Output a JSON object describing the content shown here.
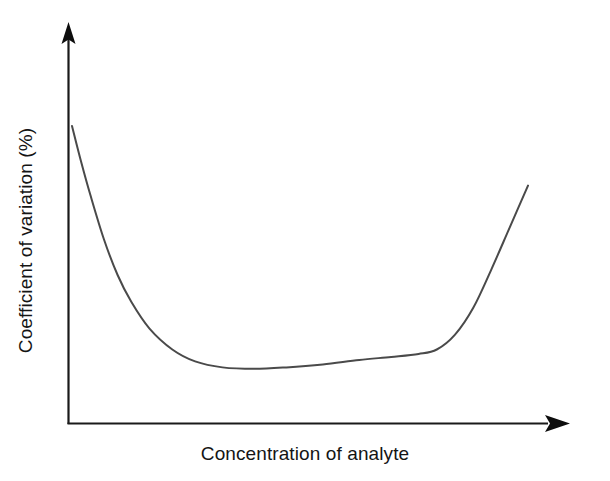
{
  "figure": {
    "background_color": "#ffffff",
    "width": 610,
    "height": 481
  },
  "chart_data": {
    "type": "line",
    "title": "",
    "subtitle": "",
    "xlabel": "Concentration of analyte",
    "ylabel": "Coefficient of variation (%)",
    "x_tick_labels": [],
    "y_tick_labels": [],
    "grid": false,
    "legend": false,
    "legend_position": "none",
    "xlim": [
      0,
      1
    ],
    "ylim": [
      0,
      1
    ],
    "axis_style": "arrow-tipped L-shaped axes, no tick marks, no numeric scale",
    "annotations": [],
    "series": [
      {
        "name": "Precision profile",
        "color": "#4a4a4a",
        "line_width": 2,
        "description": "U-shaped precision profile: coefficient of variation is very high at low analyte concentration, falls steeply to a broad shallow minimum across the mid range, then rises sharply again at high concentration.",
        "x": [
          0.0,
          0.02,
          0.04,
          0.07,
          0.1,
          0.13,
          0.17,
          0.22,
          0.27,
          0.33,
          0.4,
          0.47,
          0.55,
          0.63,
          0.7,
          0.76,
          0.8,
          0.84,
          0.88,
          0.92,
          0.96,
          1.0
        ],
        "y": [
          1.0,
          0.88,
          0.77,
          0.62,
          0.5,
          0.41,
          0.32,
          0.25,
          0.21,
          0.19,
          0.185,
          0.19,
          0.2,
          0.215,
          0.225,
          0.235,
          0.25,
          0.3,
          0.39,
          0.52,
          0.66,
          0.8
        ]
      }
    ],
    "pixel_geometry": {
      "origin": [
        68,
        424
      ],
      "y_axis_top": [
        68,
        25
      ],
      "x_axis_right": [
        570,
        424
      ],
      "curve_start": [
        72,
        126
      ],
      "curve_min": [
        230,
        357
      ],
      "curve_end": [
        528,
        244
      ]
    }
  },
  "axes": {
    "x_label_text": "Concentration of analyte",
    "y_label_text": "Coefficient of variation (%)",
    "line_color": "#1a1a1a",
    "curve_color": "#4a4a4a"
  }
}
